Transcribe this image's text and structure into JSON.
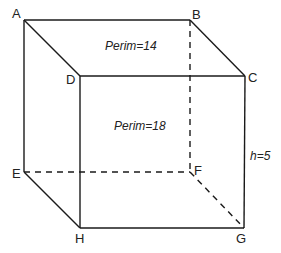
{
  "diagram": {
    "type": "rectangular-prism",
    "vertices": {
      "A": "A",
      "B": "B",
      "C": "C",
      "D": "D",
      "E": "E",
      "F": "F",
      "G": "G",
      "H": "H"
    },
    "annotations": {
      "top_perimeter": "Perim=14",
      "front_perimeter": "Perim=18",
      "height": "h=5"
    }
  }
}
